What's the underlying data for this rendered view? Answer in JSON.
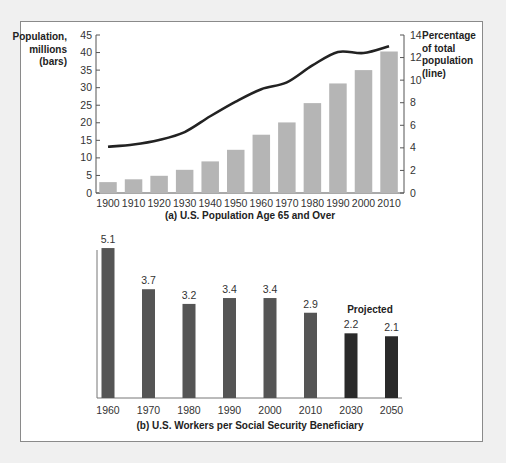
{
  "chart_data": [
    {
      "type": "bar+line",
      "title": "(a) U.S. Population Age 65 and Over",
      "categories": [
        "1900",
        "1910",
        "1920",
        "1930",
        "1940",
        "1950",
        "1960",
        "1970",
        "1980",
        "1990",
        "2000",
        "2010"
      ],
      "series": [
        {
          "name": "Population, millions (bars)",
          "type": "bar",
          "axis": "left",
          "values": [
            3.1,
            3.9,
            4.9,
            6.6,
            9.0,
            12.3,
            16.6,
            20.1,
            25.6,
            31.2,
            35.0,
            40.3
          ]
        },
        {
          "name": "Percentage of total population (line)",
          "type": "line",
          "axis": "right",
          "values": [
            4.1,
            4.3,
            4.7,
            5.4,
            6.8,
            8.1,
            9.2,
            9.8,
            11.3,
            12.5,
            12.4,
            13.0
          ]
        }
      ],
      "ylabel_left": "Population, millions (bars)",
      "ylabel_left_lines": [
        "Population,",
        "millions",
        "(bars)"
      ],
      "ylabel_right": "Percentage of total population (line)",
      "ylabel_right_lines": [
        "Percentage",
        "of total",
        "population",
        "(line)"
      ],
      "ylim_left": [
        0,
        45
      ],
      "yticks_left": [
        0,
        5,
        10,
        15,
        20,
        25,
        30,
        35,
        40,
        45
      ],
      "ylim_right": [
        0,
        14
      ],
      "yticks_right": [
        0,
        2,
        4,
        6,
        8,
        10,
        12,
        14
      ],
      "grid": false,
      "colors": {
        "bar": "#b5b5b5",
        "line": "#222222"
      }
    },
    {
      "type": "bar",
      "title": "(b) U.S. Workers per Social Security Beneficiary",
      "categories": [
        "1960",
        "1970",
        "1980",
        "1990",
        "2000",
        "2010",
        "2030",
        "2050"
      ],
      "values": [
        5.1,
        3.7,
        3.2,
        3.4,
        3.4,
        2.9,
        2.2,
        2.1
      ],
      "value_labels": [
        "5.1",
        "3.7",
        "3.2",
        "3.4",
        "3.4",
        "2.9",
        "2.2",
        "2.1"
      ],
      "annotation": "Projected",
      "projected_categories": [
        "2030",
        "2050"
      ],
      "grid": false,
      "colors": {
        "bar": "#555555",
        "projected_bar": "#2a2a2a"
      }
    }
  ]
}
